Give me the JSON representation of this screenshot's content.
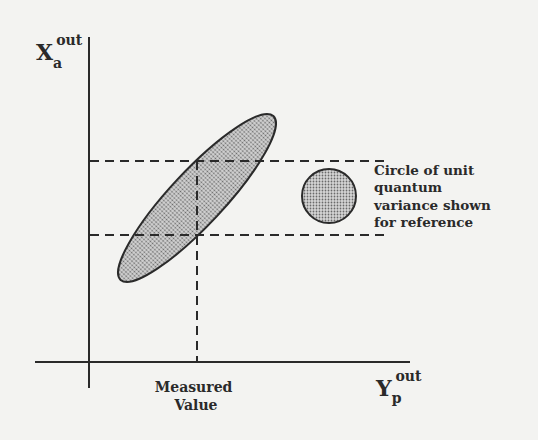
{
  "diagram": {
    "y_axis_label": {
      "main": "X",
      "sub": "a",
      "sup": "out"
    },
    "x_axis_label": {
      "main": "Y",
      "sub": "p",
      "sup": "out"
    },
    "measured_value_label": [
      "Measured",
      "Value"
    ],
    "reference_note": [
      "Circle of unit",
      "quantum",
      "variance shown",
      "for reference"
    ],
    "colors": {
      "ink": "#2a2a2a",
      "fill": "#b8b8b8",
      "background": "#f3f3f1"
    }
  }
}
